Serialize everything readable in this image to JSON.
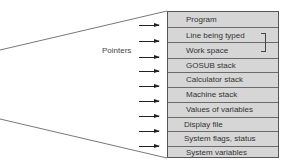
{
  "diagram": {
    "pointers_label": "Pointers",
    "memory_areas": [
      {
        "label": "Program"
      },
      {
        "label": "Line being typed"
      },
      {
        "label": "Work space"
      },
      {
        "label": "GOSUB stack"
      },
      {
        "label": "Calculator stack"
      },
      {
        "label": "Machine stack"
      },
      {
        "label": "Values of variables"
      },
      {
        "label": "Display file"
      },
      {
        "label": "System flags, status"
      },
      {
        "label": "System variables"
      }
    ],
    "arrow_count": 9,
    "colors": {
      "box_fill": "#d6d6d6",
      "divider": "#6a6a6a",
      "text": "#333333",
      "arrow": "#222222"
    }
  }
}
